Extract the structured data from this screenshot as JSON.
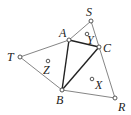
{
  "diagram": {
    "points": {
      "S": {
        "label": "S",
        "x": 91,
        "y": 21
      },
      "A": {
        "label": "A",
        "x": 69,
        "y": 40
      },
      "C": {
        "label": "C",
        "x": 99,
        "y": 47
      },
      "T": {
        "label": "T",
        "x": 20,
        "y": 57
      },
      "B": {
        "label": "B",
        "x": 62,
        "y": 90
      },
      "R": {
        "label": "R",
        "x": 115,
        "y": 98
      }
    },
    "centers": {
      "Y": {
        "label": "Y",
        "x": 87,
        "y": 34
      },
      "Z": {
        "label": "Z",
        "x": 48,
        "y": 61
      },
      "X": {
        "label": "X",
        "x": 92,
        "y": 79
      }
    }
  }
}
